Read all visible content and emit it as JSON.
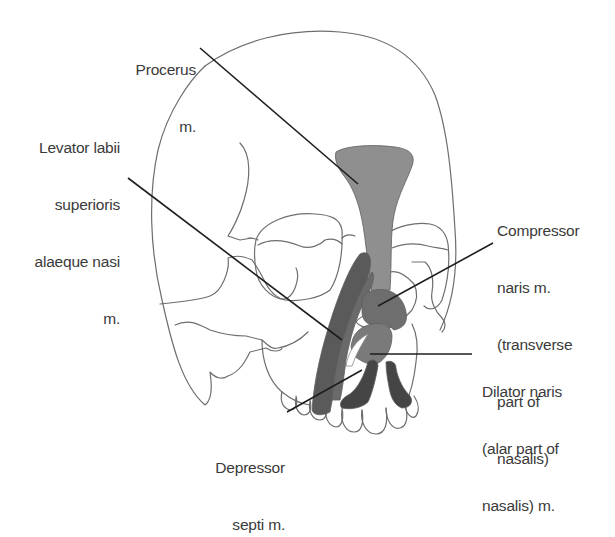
{
  "figure": {
    "colors": {
      "background": "#ffffff",
      "skull_outline": "#6e6e6e",
      "leader_line": "#1e1e1e",
      "label_text": "#3a3a3a",
      "procerus_fill": "#8f8f8f",
      "levator_fill": "#5a5a5a",
      "compressor_fill": "#6e6e6e",
      "dilator_fill": "#7a7a7a",
      "depressor_fill": "#454545"
    }
  },
  "labels": {
    "procerus": {
      "lines": [
        "Procerus",
        "m."
      ]
    },
    "levator": {
      "lines": [
        "Levator labii",
        "superioris",
        "alaeque nasi",
        "m."
      ]
    },
    "compressor": {
      "lines": [
        "Compressor",
        "naris m.",
        "(transverse",
        "part of",
        "nasalis)"
      ]
    },
    "dilator": {
      "lines": [
        "Dilator naris",
        "(alar part of",
        "nasalis) m."
      ]
    },
    "depressor": {
      "lines": [
        "Depressor",
        "septi m."
      ]
    }
  }
}
